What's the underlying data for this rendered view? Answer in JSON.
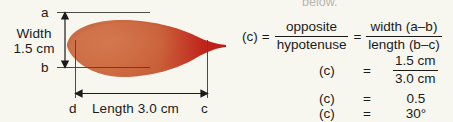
{
  "background_color": "#f7f6ef",
  "ink_color": "#1b1b1b",
  "diagram": {
    "name": "leaf-measurement-diagram",
    "leaf": {
      "body_color_light": "#cd6b41",
      "body_color_mid": "#c75e37",
      "tail_color_dark": "#c0241a",
      "shape": "leaf-ellipse-with-tail"
    },
    "vertices": {
      "a_label": "a",
      "b_label": "b",
      "c_label": "c",
      "d_label": "d"
    },
    "width_label_line1": "Width",
    "width_label_line2": "1.5 cm",
    "length_label": "Length 3.0 cm"
  },
  "formula": {
    "cutoff_text": "below.",
    "row1": {
      "lhs": "(c)",
      "equals": "=",
      "frac1_numerator": "opposite",
      "frac1_denominator": "hypotenuse",
      "equals2": "=",
      "frac2_numerator": "width (a–b)",
      "frac2_denominator": "length (b–c)"
    },
    "row2": {
      "lhs": "(c)",
      "equals": "=",
      "numerator": "1.5 cm",
      "denominator": "3.0 cm"
    },
    "row3": {
      "lhs": "(c)",
      "equals": "=",
      "rhs": "0.5"
    },
    "row4": {
      "lhs": "(c)",
      "equals": "=",
      "rhs": "30°"
    }
  }
}
